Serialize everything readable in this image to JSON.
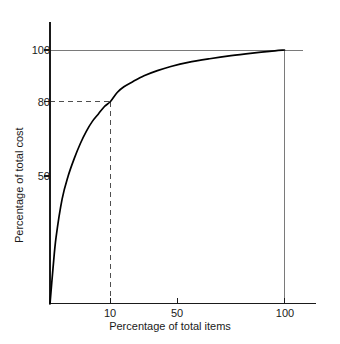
{
  "chart_data": {
    "type": "line",
    "title": "",
    "subtitle": "",
    "xlabel": "Percentage of total items",
    "ylabel": "Percentage of total cost",
    "xlim": [
      0,
      110
    ],
    "ylim": [
      0,
      108
    ],
    "xticks": [
      10,
      50,
      100
    ],
    "xtick_labels": [
      "10",
      "50",
      "100"
    ],
    "yticks": [
      50,
      80,
      100
    ],
    "ytick_labels": [
      "50",
      "80",
      "100"
    ],
    "grid": false,
    "legend": null,
    "legend_position": "none",
    "series": [
      {
        "name": "Cumulative cost curve",
        "x": [
          0,
          0.5,
          1,
          2,
          3,
          4,
          5,
          6,
          7,
          8,
          9,
          10,
          14,
          18,
          23,
          30,
          38,
          46,
          55,
          65,
          75,
          85,
          93,
          100
        ],
        "y": [
          0,
          14,
          26,
          41,
          50,
          57,
          63,
          68,
          72,
          75,
          78,
          80,
          83.5,
          85.7,
          87.6,
          90,
          92,
          93.6,
          95.2,
          96.6,
          97.8,
          98.8,
          99.5,
          100
        ]
      }
    ],
    "annotations": [
      {
        "name": "pareto-80-20-guide",
        "type": "dashed-crosshair",
        "x": 10,
        "y": 80,
        "description": "Dashed lines marking 10% of items accounting for 80% of cost"
      },
      {
        "name": "curve-endpoint-guide",
        "type": "solid-crosshair",
        "x": 100,
        "y": 100,
        "description": "Solid lines marking the 100% / 100% endpoint"
      }
    ]
  },
  "axes": {
    "x_title": "Percentage of total items",
    "y_title": "Percentage of total cost",
    "x_ticks": [
      {
        "label": "10",
        "value": 10
      },
      {
        "label": "50",
        "value": 50
      },
      {
        "label": "100",
        "value": 100
      }
    ],
    "y_ticks": [
      {
        "label": "100",
        "value": 100
      },
      {
        "label": "80",
        "value": 80
      },
      {
        "label": "50",
        "value": 50
      }
    ]
  },
  "colors": {
    "background": "#ffffff",
    "axis": "#1a1a1a",
    "curve": "#000000",
    "guide_solid": "#7a7a7a",
    "guide_dashed": "#5a5a5a",
    "text": "#1a1a1a"
  }
}
